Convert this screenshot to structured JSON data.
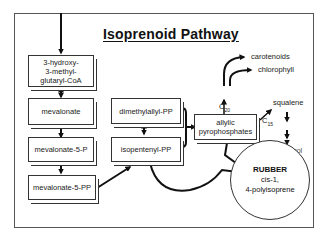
{
  "diagram": {
    "title": "Isoprenoid Pathway",
    "nodes": {
      "hmg_coa": {
        "lines": [
          "3-hydroxy-",
          "3-methyl-",
          "glutaryl-CoA"
        ]
      },
      "mevalonate": {
        "label": "mevalonate"
      },
      "mevalonate_5p": {
        "label": "mevalonate-5-P"
      },
      "mevalonate_5pp": {
        "label": "mevalonate-5-PP"
      },
      "dimethylallyl_pp": {
        "label": "dimethylallyl-PP"
      },
      "isopentenyl_pp": {
        "label": "isopentenyl-PP"
      },
      "allylic_pp": {
        "lines": [
          "allylic",
          "pyrophosphates"
        ]
      },
      "rubber": {
        "title": "RUBBER",
        "lines": [
          "cis-1,",
          "4-polyisoprene"
        ]
      }
    },
    "labels": {
      "c20": "C",
      "c20_sub": "20",
      "c15": "C",
      "c15_sub": "15",
      "carotenoids": "carotenoids",
      "chlorophyll": "chlorophyll",
      "squalene": "squalene",
      "cholesterol": "cholesterol"
    },
    "edges": [
      {
        "from": "top",
        "to": "hmg_coa"
      },
      {
        "from": "hmg_coa",
        "to": "mevalonate",
        "bidirectional": true
      },
      {
        "from": "mevalonate",
        "to": "mevalonate_5p"
      },
      {
        "from": "mevalonate_5p",
        "to": "mevalonate_5pp"
      },
      {
        "from": "mevalonate_5pp",
        "to": "isopentenyl_pp"
      },
      {
        "from": "dimethylallyl_pp",
        "to": "isopentenyl_pp",
        "bidirectional": true
      },
      {
        "from": "dimethylallyl_pp+isopentenyl_pp",
        "to": "allylic_pp"
      },
      {
        "from": "allylic_pp",
        "to": "carotenoids",
        "via": "C20"
      },
      {
        "from": "allylic_pp",
        "to": "chlorophyll",
        "via": "C20"
      },
      {
        "from": "allylic_pp",
        "to": "squalene",
        "via": "C15"
      },
      {
        "from": "squalene",
        "to": "cholesterol"
      },
      {
        "from": "allylic_pp",
        "to": "rubber"
      },
      {
        "from": "isopentenyl_pp",
        "to": "rubber"
      }
    ]
  }
}
